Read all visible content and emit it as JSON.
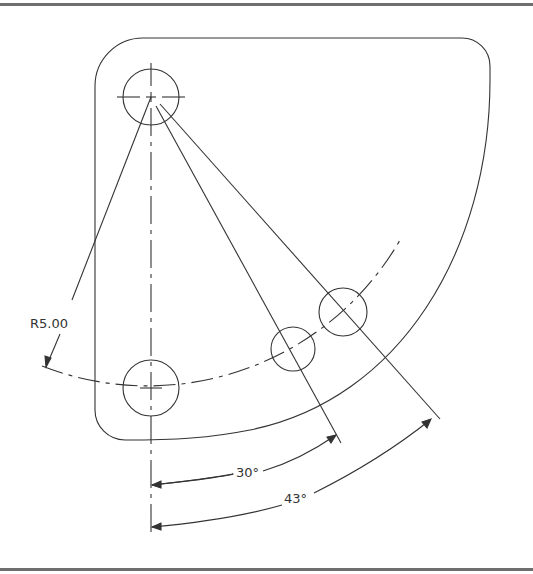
{
  "drawing": {
    "type": "CAD bolt-circle plate drawing",
    "line_color": "#333333",
    "frame_color": "#6e6e6e",
    "background": "#ffffff"
  },
  "dimensions": {
    "radius_label": "R5.00",
    "angle_1_label": "30°",
    "angle_2_label": "43°"
  },
  "features": {
    "holes": [
      {
        "name": "pivot-hole",
        "cx": 151,
        "cy": 97,
        "r": 28
      },
      {
        "name": "bottom-hole",
        "cx": 151,
        "cy": 388,
        "r": 28
      },
      {
        "name": "hole-30deg",
        "cx": 293,
        "cy": 349,
        "r": 22
      },
      {
        "name": "hole-43deg",
        "cx": 343,
        "cy": 312,
        "r": 24
      }
    ],
    "bolt_circle_radius_px": 291
  }
}
